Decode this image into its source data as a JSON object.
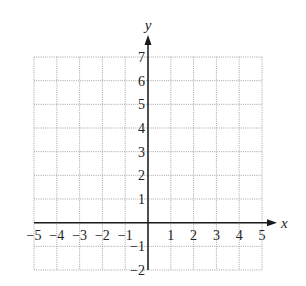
{
  "chart_data": {
    "type": "scatter",
    "title": "",
    "xlabel": "x",
    "ylabel": "y",
    "xlim": [
      -5,
      5
    ],
    "ylim": [
      -2,
      7
    ],
    "grid": true,
    "grid_style": "dotted",
    "x_ticks": [
      -5,
      -4,
      -3,
      -2,
      -1,
      1,
      2,
      3,
      4,
      5
    ],
    "y_ticks": [
      -2,
      -1,
      1,
      2,
      3,
      4,
      5,
      6,
      7
    ],
    "x_tick_labels": [
      "−5",
      "−4",
      "−3",
      "−2",
      "−1",
      "1",
      "2",
      "3",
      "4",
      "5"
    ],
    "y_tick_labels": [
      "−2",
      "−1",
      "1",
      "2",
      "3",
      "4",
      "5",
      "6",
      "7"
    ],
    "series": [],
    "legend": null,
    "axes_arrows": true
  },
  "colors": {
    "grid": "#9a9a9a",
    "axis": "#1a1a1a",
    "text": "#222222",
    "background": "#ffffff"
  },
  "layout": {
    "x0_px": 34,
    "x1_px": 262,
    "y_top_px": 57,
    "y_bottom_px": 270,
    "x_axis_end_px": 277,
    "y_axis_end_px": 35
  }
}
